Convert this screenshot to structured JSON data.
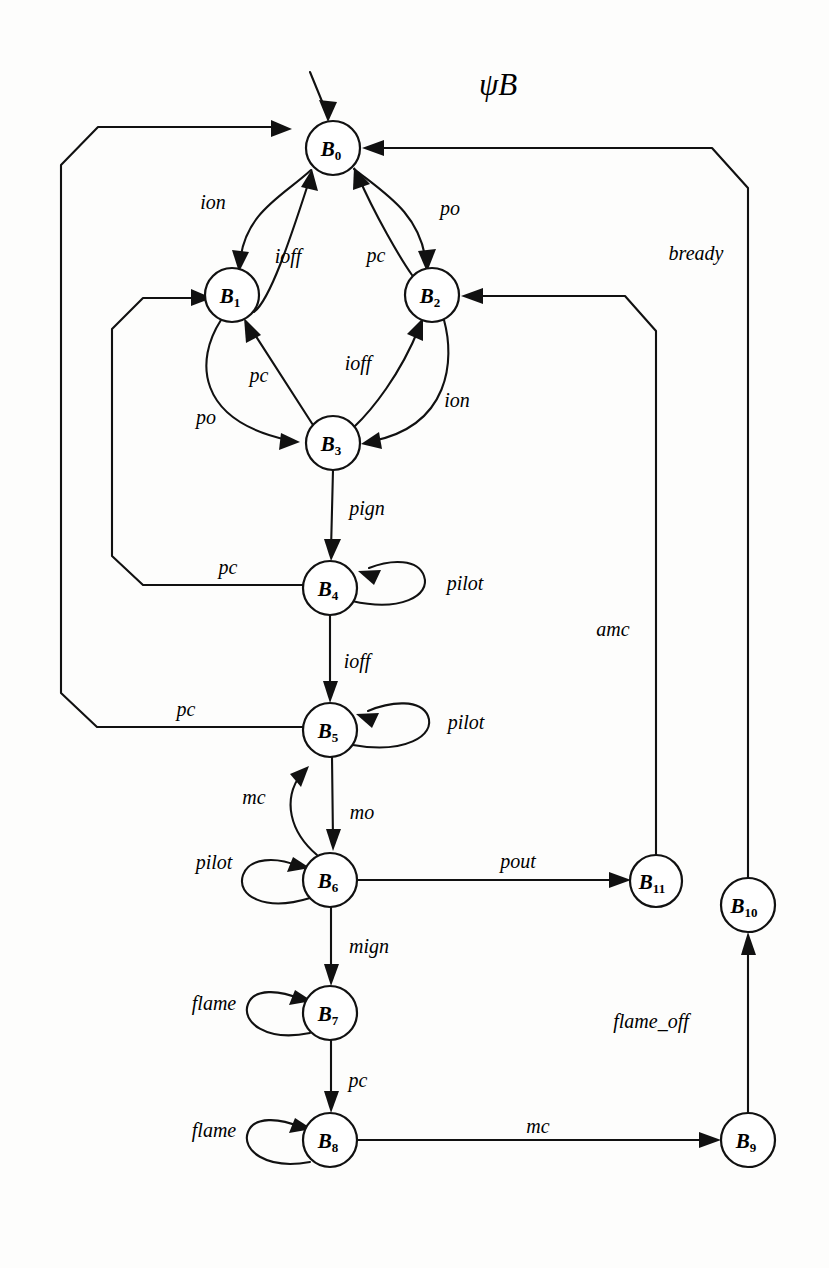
{
  "title": {
    "text": "ψB",
    "x": 498,
    "y": 84
  },
  "graph": {
    "type": "state-transition-diagram",
    "node_radius": 27,
    "initial_state": "B0",
    "nodes": [
      {
        "id": "B0",
        "base": "B",
        "sub": "0",
        "x": 333,
        "y": 148
      },
      {
        "id": "B1",
        "base": "B",
        "sub": "1",
        "x": 232,
        "y": 295
      },
      {
        "id": "B2",
        "base": "B",
        "sub": "2",
        "x": 432,
        "y": 295
      },
      {
        "id": "B3",
        "base": "B",
        "sub": "3",
        "x": 333,
        "y": 443
      },
      {
        "id": "B4",
        "base": "B",
        "sub": "4",
        "x": 330,
        "y": 588
      },
      {
        "id": "B5",
        "base": "B",
        "sub": "5",
        "x": 330,
        "y": 730
      },
      {
        "id": "B6",
        "base": "B",
        "sub": "6",
        "x": 330,
        "y": 880
      },
      {
        "id": "B7",
        "base": "B",
        "sub": "7",
        "x": 330,
        "y": 1013
      },
      {
        "id": "B8",
        "base": "B",
        "sub": "8",
        "x": 330,
        "y": 1140
      },
      {
        "id": "B9",
        "base": "B",
        "sub": "9",
        "x": 748,
        "y": 1140
      },
      {
        "id": "B10",
        "base": "B",
        "sub": "10",
        "x": 748,
        "y": 905
      },
      {
        "id": "B11",
        "base": "B",
        "sub": "11",
        "x": 656,
        "y": 881
      }
    ],
    "transitions": [
      {
        "id": "t-b0-b1",
        "from": "B0",
        "to": "B1",
        "label": "ion",
        "label_x": 213,
        "label_y": 202
      },
      {
        "id": "t-b1-b0",
        "from": "B1",
        "to": "B0",
        "label": "ioff",
        "label_x": 288,
        "label_y": 256
      },
      {
        "id": "t-b0-b2",
        "from": "B0",
        "to": "B2",
        "label": "po",
        "label_x": 450,
        "label_y": 208
      },
      {
        "id": "t-b2-b0",
        "from": "B2",
        "to": "B0",
        "label": "pc",
        "label_x": 376,
        "label_y": 255
      },
      {
        "id": "t-b1-b3",
        "from": "B1",
        "to": "B3",
        "label": "po",
        "label_x": 206,
        "label_y": 417
      },
      {
        "id": "t-b3-b1",
        "from": "B3",
        "to": "B1",
        "label": "pc",
        "label_x": 259,
        "label_y": 375
      },
      {
        "id": "t-b3-b2",
        "from": "B3",
        "to": "B2",
        "label": "ioff",
        "label_x": 358,
        "label_y": 363
      },
      {
        "id": "t-b2-b3",
        "from": "B2",
        "to": "B3",
        "label": "ion",
        "label_x": 457,
        "label_y": 400
      },
      {
        "id": "t-b3-b4",
        "from": "B3",
        "to": "B4",
        "label": "pign",
        "label_x": 367,
        "label_y": 508
      },
      {
        "id": "t-b4-b4",
        "from": "B4",
        "to": "B4",
        "label": "pilot",
        "label_x": 465,
        "label_y": 583
      },
      {
        "id": "t-b4-b1",
        "from": "B4",
        "to": "B1",
        "label": "pc",
        "label_x": 228,
        "label_y": 567
      },
      {
        "id": "t-b4-b5",
        "from": "B4",
        "to": "B5",
        "label": "ioff",
        "label_x": 357,
        "label_y": 661
      },
      {
        "id": "t-b5-b5",
        "from": "B5",
        "to": "B5",
        "label": "pilot",
        "label_x": 466,
        "label_y": 722
      },
      {
        "id": "t-b5-b0",
        "from": "B5",
        "to": "B0",
        "label": "pc",
        "label_x": 186,
        "label_y": 709
      },
      {
        "id": "t-b5-b6",
        "from": "B5",
        "to": "B6",
        "label": "mo",
        "label_x": 362,
        "label_y": 812
      },
      {
        "id": "t-b6-b5",
        "from": "B6",
        "to": "B5",
        "label": "mc",
        "label_x": 254,
        "label_y": 797
      },
      {
        "id": "t-b6-b6",
        "from": "B6",
        "to": "B6",
        "label": "pilot",
        "label_x": 214,
        "label_y": 862
      },
      {
        "id": "t-b6-b11",
        "from": "B6",
        "to": "B11",
        "label": "pout",
        "label_x": 518,
        "label_y": 861
      },
      {
        "id": "t-b6-b7",
        "from": "B6",
        "to": "B7",
        "label": "mign",
        "label_x": 369,
        "label_y": 946
      },
      {
        "id": "t-b7-b7",
        "from": "B7",
        "to": "B7",
        "label": "flame",
        "label_x": 214,
        "label_y": 1003
      },
      {
        "id": "t-b7-b8",
        "from": "B7",
        "to": "B8",
        "label": "pc",
        "label_x": 358,
        "label_y": 1080
      },
      {
        "id": "t-b8-b8",
        "from": "B8",
        "to": "B8",
        "label": "flame",
        "label_x": 214,
        "label_y": 1130
      },
      {
        "id": "t-b8-b9",
        "from": "B8",
        "to": "B9",
        "label": "mc",
        "label_x": 538,
        "label_y": 1126
      },
      {
        "id": "t-b9-b10",
        "from": "B9",
        "to": "B10",
        "label": "flame_off",
        "label_x": 651,
        "label_y": 1021
      },
      {
        "id": "t-b10-b0",
        "from": "B10",
        "to": "B0",
        "label": "bready",
        "label_x": 696,
        "label_y": 253
      },
      {
        "id": "t-b11-b2",
        "from": "B11",
        "to": "B2",
        "label": "amc",
        "label_x": 613,
        "label_y": 629
      }
    ]
  }
}
